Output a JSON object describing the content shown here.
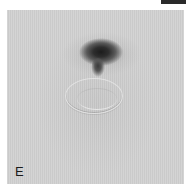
{
  "figure": {
    "panel_label": "E",
    "colors": {
      "background": "#cecece",
      "dark_region": "#1c1c1c",
      "top_bar": "#2a2a2a"
    }
  }
}
